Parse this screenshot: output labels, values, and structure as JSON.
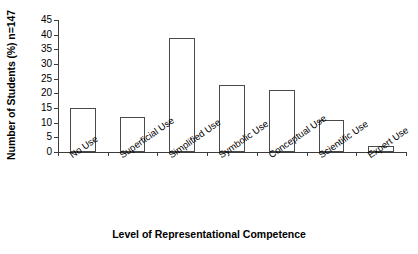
{
  "chart_data": {
    "type": "bar",
    "title": "",
    "xlabel": "Level of Representational Competence",
    "ylabel": "Number of Students (%) n=147",
    "categories": [
      "No Use",
      "Superficial Use",
      "Simplified Use",
      "Symbolic Use",
      "Conceptual Use",
      "Scientific Use",
      "Expert Use"
    ],
    "values": [
      15,
      12,
      39,
      23,
      21,
      11,
      2
    ],
    "ylim": [
      0,
      45
    ],
    "ytick_step": 5,
    "yticks": [
      "0",
      "5",
      "10",
      "15",
      "20",
      "25",
      "30",
      "35",
      "40",
      "45"
    ],
    "grid": false,
    "legend": false,
    "bar_fill_color": "#ffffff",
    "bar_edge_color": "#4a4a4a",
    "axis_color": "#3c3c3c",
    "sample_size": "n=147"
  }
}
